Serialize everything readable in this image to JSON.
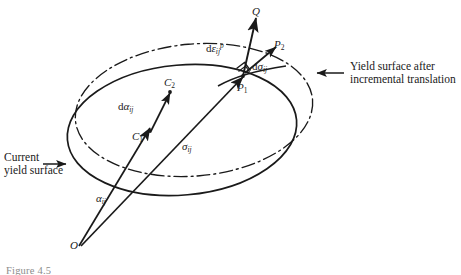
{
  "figure": {
    "type": "engineering-diagram",
    "background_color": "#ffffff",
    "ink_color": "#1a1a1a"
  },
  "callouts": [
    {
      "id": "current-yield-surface",
      "line1": "Current",
      "line2": "yield surface",
      "arrow_direction": "right"
    },
    {
      "id": "translated-yield-surface",
      "line1": "Yield surface after",
      "line2": "incremental translation",
      "arrow_direction": "left"
    }
  ],
  "points": {
    "origin": "O",
    "center_initial": "C",
    "center_initial_sub": "1",
    "center_final": "C",
    "center_final_sub": "2",
    "stress_point": "P",
    "stress_point_sub": "1",
    "stress_point_new": "P",
    "stress_point_new_sub": "2",
    "normal_tip": "Q"
  },
  "vectors": {
    "backstress": {
      "symbol": "α",
      "sub": "ij"
    },
    "stress": {
      "symbol": "σ",
      "sub": "ij"
    },
    "backstress_increment": {
      "prefix": "d",
      "symbol": "α",
      "sub": "ij"
    },
    "stress_increment": {
      "prefix": "d",
      "symbol": "σ",
      "sub": "ij"
    },
    "plastic_strain_increment": {
      "prefix": "d",
      "symbol": "ε",
      "sub": "ij",
      "sup": "p"
    }
  },
  "surfaces": {
    "current": {
      "style": "solid",
      "name": "current yield surface"
    },
    "translated": {
      "style": "dash-dot",
      "name": "translated yield surface"
    }
  },
  "markers": {
    "right_angle": "perpendicularity of plastic strain increment to yield surface"
  },
  "caption": "Figure 4.5"
}
